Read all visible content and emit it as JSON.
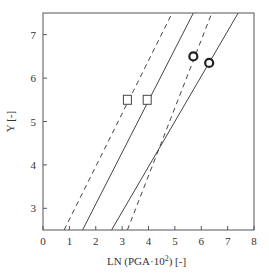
{
  "chart_data": {
    "type": "line",
    "title": "",
    "xlabel": "LN (PGA·10",
    "xlabel_sup": "2",
    "xlabel_suffix": ") [-]",
    "ylabel": "Y [-]",
    "xlim": [
      0,
      8
    ],
    "ylim": [
      2.5,
      7.5
    ],
    "xticks": [
      0,
      1,
      2,
      3,
      4,
      5,
      6,
      7,
      8
    ],
    "yticks": [
      3,
      4,
      5,
      6,
      7
    ],
    "grid": false,
    "legend": null,
    "series": [
      {
        "name": "dashed-left",
        "style": "dashed",
        "x": [
          0.8,
          4.9
        ],
        "y": [
          2.5,
          7.5
        ]
      },
      {
        "name": "solid-left",
        "style": "solid",
        "x": [
          1.5,
          5.7
        ],
        "y": [
          2.5,
          7.5
        ]
      },
      {
        "name": "solid-right",
        "style": "solid",
        "x": [
          2.6,
          7.4
        ],
        "y": [
          2.5,
          7.5
        ]
      },
      {
        "name": "dashed-right",
        "style": "dashed",
        "x": [
          3.2,
          6.4
        ],
        "y": [
          2.5,
          7.5
        ]
      }
    ],
    "markers": [
      {
        "shape": "square",
        "x": 3.2,
        "y": 5.5
      },
      {
        "shape": "square",
        "x": 3.95,
        "y": 5.5
      },
      {
        "shape": "circle",
        "x": 5.7,
        "y": 6.5
      },
      {
        "shape": "circle",
        "x": 6.3,
        "y": 6.35
      }
    ]
  }
}
